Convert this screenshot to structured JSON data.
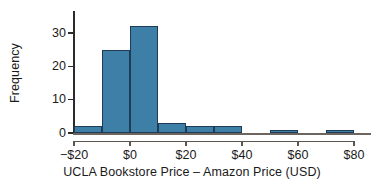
{
  "chart_data": {
    "type": "bar",
    "subtype": "histogram",
    "title": "",
    "xlabel": "UCLA Bookstore Price – Amazon Price (USD)",
    "ylabel": "Frequency",
    "xlim": [
      -20,
      80
    ],
    "ylim": [
      0,
      36.6
    ],
    "bin_width": 10,
    "grid": false,
    "legend": null,
    "bar_color": "#3e7fa8",
    "bar_edge_color": "#1e3c55",
    "axis_color": "#2b2b2b",
    "background": "#ffffff",
    "bins": [
      {
        "start": -20,
        "end": -10,
        "count": 2
      },
      {
        "start": -10,
        "end": 0,
        "count": 25
      },
      {
        "start": 0,
        "end": 10,
        "count": 32
      },
      {
        "start": 10,
        "end": 20,
        "count": 3
      },
      {
        "start": 20,
        "end": 30,
        "count": 2
      },
      {
        "start": 30,
        "end": 40,
        "count": 2
      },
      {
        "start": 40,
        "end": 50,
        "count": 0
      },
      {
        "start": 50,
        "end": 60,
        "count": 1
      },
      {
        "start": 60,
        "end": 70,
        "count": 0
      },
      {
        "start": 70,
        "end": 80,
        "count": 1
      }
    ],
    "categories": [
      "-20 to -10",
      "-10 to 0",
      "0 to 10",
      "10 to 20",
      "20 to 30",
      "30 to 40",
      "40 to 50",
      "50 to 60",
      "60 to 70",
      "70 to 80"
    ],
    "values": [
      2,
      25,
      32,
      3,
      2,
      2,
      0,
      1,
      0,
      1
    ],
    "x_ticks": [
      {
        "value": -20,
        "label": "−$20"
      },
      {
        "value": 0,
        "label": "$0"
      },
      {
        "value": 20,
        "label": "$20"
      },
      {
        "value": 40,
        "label": "$40"
      },
      {
        "value": 60,
        "label": "$60"
      },
      {
        "value": 80,
        "label": "$80"
      }
    ],
    "y_ticks": [
      {
        "value": 0,
        "label": "0"
      },
      {
        "value": 10,
        "label": "10"
      },
      {
        "value": 20,
        "label": "20"
      },
      {
        "value": 30,
        "label": "30"
      }
    ]
  }
}
